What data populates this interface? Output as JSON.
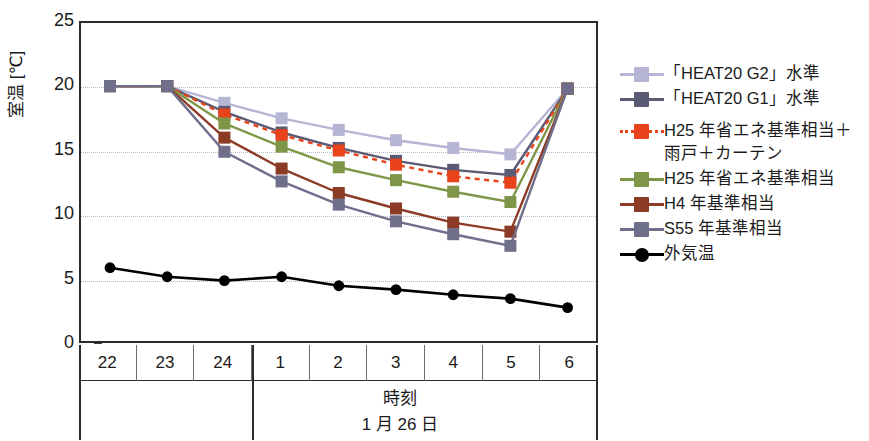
{
  "chart_data": {
    "type": "line",
    "title": "",
    "xlabel": "時刻",
    "xsublabel": "1 月 26 日",
    "ylabel": "室温 [℃]",
    "ylim": [
      0,
      25
    ],
    "yticks": [
      0,
      5,
      10,
      15,
      20,
      25
    ],
    "categories": [
      "22",
      "23",
      "24",
      "1",
      "2",
      "3",
      "4",
      "5",
      "6"
    ],
    "grid": "horizontal-dotted",
    "legend_position": "right",
    "day_divider_after": "24",
    "series": [
      {
        "name": "「HEAT20 G2」水準",
        "color": "#b6b6d4",
        "line": "solid",
        "marker": "square",
        "values": [
          20.1,
          20.1,
          18.8,
          17.6,
          16.7,
          15.9,
          15.3,
          14.8,
          19.9
        ]
      },
      {
        "name": "「HEAT20 G1」水準",
        "color": "#5a5a74",
        "line": "solid",
        "marker": "square",
        "values": [
          20.1,
          20.1,
          18.1,
          16.5,
          15.3,
          14.3,
          13.6,
          13.2,
          19.9
        ]
      },
      {
        "name": "H25 年省エネ基準相当＋\n雨戸＋カーテン",
        "color": "#e8431b",
        "line": "dotted",
        "marker": "square",
        "values": [
          20.1,
          20.1,
          17.9,
          16.3,
          15.1,
          14.0,
          13.1,
          12.6,
          19.9
        ]
      },
      {
        "name": "H25 年省エネ基準相当",
        "color": "#7f9649",
        "line": "solid",
        "marker": "square",
        "values": [
          20.1,
          20.1,
          17.2,
          15.4,
          13.8,
          12.8,
          11.9,
          11.1,
          19.9
        ]
      },
      {
        "name": "H4 年基準相当",
        "color": "#8c3c26",
        "line": "solid",
        "marker": "square",
        "values": [
          20.1,
          20.1,
          16.1,
          13.7,
          11.8,
          10.6,
          9.5,
          8.8,
          19.9
        ]
      },
      {
        "name": "S55 年基準相当",
        "color": "#6f6f8c",
        "line": "solid",
        "marker": "square",
        "values": [
          20.1,
          20.1,
          15.0,
          12.7,
          10.9,
          9.6,
          8.6,
          7.7,
          19.9
        ]
      },
      {
        "name": "外気温",
        "color": "#000000",
        "line": "solid",
        "marker": "circle",
        "values": [
          6.0,
          5.3,
          5.0,
          5.3,
          4.6,
          4.3,
          3.9,
          3.6,
          2.9
        ]
      }
    ]
  }
}
